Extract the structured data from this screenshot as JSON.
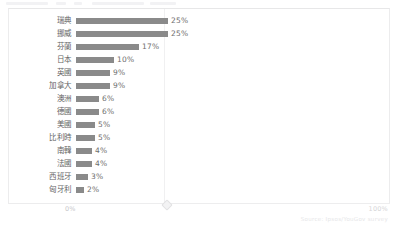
{
  "top_strip": {
    "segments": [
      {
        "left": 6,
        "width": 42
      },
      {
        "left": 56,
        "width": 10
      },
      {
        "left": 74,
        "width": 8
      },
      {
        "left": 92,
        "width": 52
      },
      {
        "left": 150,
        "width": 26
      }
    ]
  },
  "axis": {
    "min_label": "0%",
    "max_label": "100%",
    "handle_icon": "diamond-handle-icon"
  },
  "source": {
    "text": "Source: Ipsos/YouGov survey"
  },
  "chart_data": {
    "type": "bar",
    "orientation": "horizontal",
    "title": "",
    "subtitle": "",
    "xlabel": "",
    "ylabel": "",
    "xlim": [
      0,
      100
    ],
    "grid": true,
    "legend": false,
    "unit": "%",
    "categories": [
      "瑞典",
      "挪威",
      "芬蘭",
      "日本",
      "英國",
      "加拿大",
      "澳洲",
      "德國",
      "美國",
      "比利時",
      "南韓",
      "法國",
      "西班牙",
      "匈牙利"
    ],
    "values": [
      25,
      25,
      17,
      10,
      9,
      9,
      6,
      6,
      5,
      5,
      4,
      4,
      3,
      2
    ],
    "value_labels": [
      "25%",
      "25%",
      "17%",
      "10%",
      "9%",
      "9%",
      "6%",
      "6%",
      "5%",
      "5%",
      "4%",
      "4%",
      "3%",
      "2%"
    ],
    "bar_color": "#8a8a8a",
    "bar_pixel_widths": [
      92,
      92,
      63,
      38,
      34,
      34,
      23,
      23,
      19,
      19,
      16,
      16,
      12,
      8
    ]
  }
}
